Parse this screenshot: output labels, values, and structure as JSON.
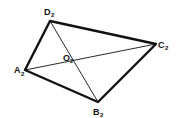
{
  "diagram": {
    "type": "quadrilateral-with-diagonals",
    "stroke_color": "#111111",
    "background": "#ffffff",
    "vertices": [
      {
        "name": "A",
        "sub": "2",
        "x": 25,
        "y": 70
      },
      {
        "name": "B",
        "sub": "2",
        "x": 98,
        "y": 102
      },
      {
        "name": "C",
        "sub": "2",
        "x": 156,
        "y": 44
      },
      {
        "name": "D",
        "sub": "2",
        "x": 50,
        "y": 21
      }
    ],
    "center": {
      "name": "O",
      "sub": "2",
      "x": 63,
      "y": 65
    },
    "labels": {
      "A": "A",
      "A_sub": "2",
      "B": "B",
      "B_sub": "2",
      "C": "C",
      "C_sub": "2",
      "D": "D",
      "D_sub": "2",
      "O": "O",
      "O_sub": "2"
    }
  }
}
